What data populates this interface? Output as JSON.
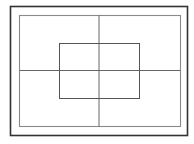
{
  "diagram": {
    "canvas": {
      "width": 194,
      "height": 144,
      "background": "#ffffff"
    },
    "outer_frame": {
      "x": 10.5,
      "y": 6.5,
      "width": 177,
      "height": 129,
      "stroke": "#333333",
      "stroke_width": 1.6
    },
    "inner_rect": {
      "x": 19.5,
      "y": 15.5,
      "width": 161,
      "height": 111,
      "stroke": "#8a8a8a",
      "stroke_width": 1.1
    },
    "center_rect": {
      "x": 59.5,
      "y": 43.5,
      "width": 80,
      "height": 55,
      "stroke": "#555555",
      "stroke_width": 1
    },
    "vertical_divider": {
      "x": 99,
      "y1": 15.5,
      "y2": 126.5,
      "stroke": "#666666",
      "stroke_width": 1
    },
    "horizontal_divider": {
      "y": 70.5,
      "x1": 19.5,
      "x2": 180.5,
      "stroke": "#666666",
      "stroke_width": 1
    }
  }
}
